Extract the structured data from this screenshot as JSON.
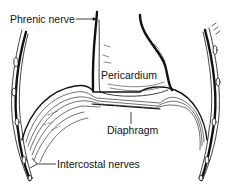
{
  "diagram": {
    "labels": {
      "phrenic_nerve": "Phrenic nerve",
      "pericardium": "Pericardium",
      "diaphragm": "Diaphragm",
      "intercostal_nerves": "Intercostal nerves"
    },
    "colors": {
      "ink": "#111111",
      "background": "#ffffff"
    }
  }
}
